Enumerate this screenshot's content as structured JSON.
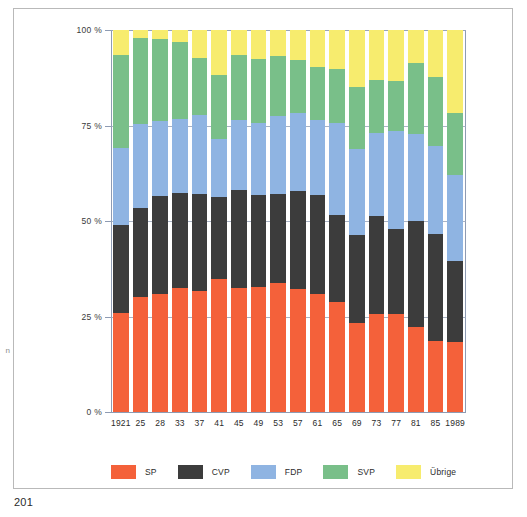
{
  "page": {
    "folio": "201",
    "margin_glyph": "n"
  },
  "legend": {
    "items": [
      {
        "label": "SP",
        "color": "#f4613a"
      },
      {
        "label": "CVP",
        "color": "#3c3c3c"
      },
      {
        "label": "FDP",
        "color": "#8fb4e2"
      },
      {
        "label": "SVP",
        "color": "#79bf89"
      },
      {
        "label": "Übrige",
        "color": "#f7ec6e"
      }
    ]
  },
  "axes": {
    "y_tick_labels": [
      "0 %",
      "25 %",
      "50 %",
      "75 %",
      "100 %"
    ],
    "y_tick_values": [
      0,
      25,
      50,
      75,
      100
    ]
  },
  "chart_data": {
    "type": "bar",
    "stacked": true,
    "title": "",
    "subtitle": "",
    "xlabel": "",
    "ylabel": "",
    "ylim": [
      0,
      100
    ],
    "grid": true,
    "legend_position": "bottom",
    "categories": [
      "1921",
      "25",
      "28",
      "33",
      "37",
      "41",
      "45",
      "49",
      "53",
      "57",
      "61",
      "65",
      "69",
      "73",
      "77",
      "81",
      "85",
      "1989"
    ],
    "series": [
      {
        "name": "SP",
        "color": "#f4613a",
        "values": [
          25.8,
          30.0,
          31.0,
          32.4,
          31.7,
          34.9,
          32.4,
          32.8,
          33.8,
          32.1,
          31.0,
          28.8,
          23.4,
          25.7,
          25.6,
          22.3,
          18.7,
          18.4
        ]
      },
      {
        "name": "CVP",
        "color": "#3c3c3c",
        "values": [
          23.2,
          23.5,
          25.6,
          25.0,
          25.3,
          21.3,
          25.6,
          23.9,
          23.4,
          25.8,
          25.9,
          22.8,
          22.9,
          25.5,
          22.2,
          27.6,
          28.0,
          21.1
        ]
      },
      {
        "name": "FDP",
        "color": "#8fb4e2",
        "values": [
          20.0,
          22.0,
          19.6,
          19.2,
          20.7,
          15.3,
          18.5,
          19.0,
          20.4,
          20.5,
          19.5,
          24.1,
          22.5,
          21.8,
          25.8,
          22.8,
          23.0,
          22.6
        ]
      },
      {
        "name": "SVP",
        "color": "#79bf89",
        "values": [
          24.4,
          22.4,
          21.4,
          20.2,
          15.1,
          16.6,
          17.0,
          16.6,
          15.5,
          13.7,
          13.9,
          14.1,
          16.4,
          13.9,
          13.0,
          18.7,
          18.1,
          16.2
        ]
      },
      {
        "name": "Übrige",
        "color": "#f7ec6e",
        "values": [
          6.6,
          2.1,
          2.4,
          3.2,
          7.2,
          11.9,
          6.5,
          7.7,
          6.9,
          7.9,
          9.7,
          10.2,
          14.8,
          13.1,
          13.4,
          8.6,
          12.2,
          21.7
        ]
      }
    ]
  }
}
